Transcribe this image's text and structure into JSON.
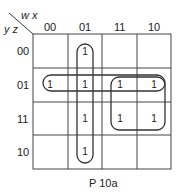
{
  "kmap": {
    "row_var_label": "y z",
    "col_var_label": "w x",
    "col_headers": [
      "00",
      "01",
      "11",
      "10"
    ],
    "row_headers": [
      "00",
      "01",
      "11",
      "10"
    ],
    "cells": [
      [
        "",
        "1",
        "",
        ""
      ],
      [
        "1",
        "1",
        "1",
        "1"
      ],
      [
        "",
        "1",
        "1",
        "1"
      ],
      [
        "",
        "1",
        "",
        ""
      ]
    ],
    "caption": "P 10a",
    "groups": [
      {
        "name": "column-01",
        "cells": "all rows of column 01"
      },
      {
        "name": "row-01",
        "cells": "all columns of row 01"
      },
      {
        "name": "quad-11-10",
        "cells": "rows 01,11 x cols 11,10"
      }
    ]
  }
}
